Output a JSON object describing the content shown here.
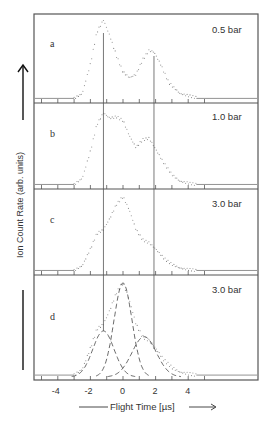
{
  "chart_data": {
    "type": "line",
    "layout": "stacked-panels",
    "ylabel": "Ion Count Rate (arb. units)",
    "xlabel": "Flight Time [µs]",
    "xticks": [
      -4,
      -2,
      0,
      2,
      4
    ],
    "xlim": [
      -5.5,
      8.2
    ],
    "reference_lines_x": [
      -1.2,
      1.9
    ],
    "panels": [
      {
        "id": "a",
        "label": "a",
        "pressure": "0.5 bar",
        "series": [
          {
            "name": "measured",
            "style": "dotted",
            "x": [
              -5.5,
              -3,
              -2.5,
              -2,
              -1.6,
              -1.2,
              -0.8,
              -0.4,
              0,
              0.4,
              0.8,
              1.2,
              1.6,
              1.9,
              2.3,
              2.8,
              3.5,
              4.5,
              8.2
            ],
            "y": [
              0.02,
              0.02,
              0.08,
              0.45,
              0.85,
              1.0,
              0.8,
              0.55,
              0.35,
              0.28,
              0.32,
              0.5,
              0.62,
              0.6,
              0.45,
              0.22,
              0.08,
              0.03,
              0.02
            ]
          }
        ]
      },
      {
        "id": "b",
        "label": "b",
        "pressure": "1.0 bar",
        "series": [
          {
            "name": "measured",
            "style": "dotted",
            "x": [
              -5.5,
              -3,
              -2.5,
              -2,
              -1.6,
              -1.2,
              -0.8,
              -0.4,
              0,
              0.4,
              0.8,
              1.2,
              1.6,
              2.0,
              2.5,
              3,
              3.5,
              4.5,
              8.2
            ],
            "y": [
              0.02,
              0.02,
              0.1,
              0.45,
              0.8,
              0.95,
              0.88,
              0.9,
              0.85,
              0.65,
              0.5,
              0.6,
              0.62,
              0.48,
              0.3,
              0.15,
              0.06,
              0.02,
              0.02
            ]
          }
        ]
      },
      {
        "id": "c",
        "label": "c",
        "pressure": "3.0 bar",
        "series": [
          {
            "name": "measured",
            "style": "dotted",
            "x": [
              -5.5,
              -3,
              -2.5,
              -2,
              -1.6,
              -1.2,
              -0.8,
              -0.4,
              0,
              0.4,
              0.8,
              1.2,
              1.6,
              2.0,
              2.5,
              3,
              3.5,
              4.5,
              8.2
            ],
            "y": [
              0.02,
              0.02,
              0.08,
              0.3,
              0.5,
              0.55,
              0.7,
              0.88,
              0.98,
              0.8,
              0.55,
              0.42,
              0.38,
              0.3,
              0.18,
              0.1,
              0.05,
              0.02,
              0.02
            ]
          }
        ]
      },
      {
        "id": "d",
        "label": "d",
        "pressure": "3.0 bar",
        "series": [
          {
            "name": "measured",
            "style": "dotted",
            "x": [
              -5.5,
              -3,
              -2.5,
              -2,
              -1.6,
              -1.2,
              -0.8,
              -0.4,
              0,
              0.4,
              0.8,
              1.2,
              1.6,
              2.0,
              2.5,
              3,
              3.5,
              4.5,
              8.2
            ],
            "y": [
              0.02,
              0.02,
              0.08,
              0.3,
              0.5,
              0.55,
              0.7,
              0.88,
              0.98,
              0.8,
              0.55,
              0.42,
              0.38,
              0.3,
              0.18,
              0.1,
              0.05,
              0.02,
              0.02
            ]
          },
          {
            "name": "fit component 1 (center -1.2)",
            "style": "dashed",
            "center": -1.2,
            "amplitude": 0.48,
            "width": 0.65
          },
          {
            "name": "fit component 2 (center 0)",
            "style": "dashed",
            "center": 0.0,
            "amplitude": 0.98,
            "width": 0.55
          },
          {
            "name": "fit component 3 (center 1.3)",
            "style": "dashed",
            "center": 1.3,
            "amplitude": 0.42,
            "width": 0.75
          }
        ]
      }
    ]
  }
}
